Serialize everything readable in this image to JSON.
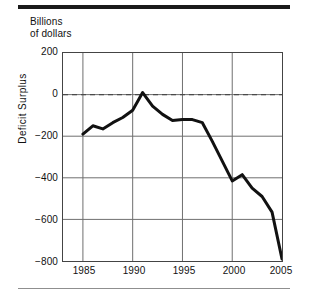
{
  "figure": {
    "title": "Billions\nof dollars",
    "rule_color": "#1a1a1a",
    "line_color": "#111111",
    "grid_color": "#6f6f6f",
    "frame_color": "#444444"
  },
  "chart_data": {
    "type": "line",
    "title": "Billions of dollars",
    "xlabel": "",
    "ylabel": "Deficit  Surplus",
    "xlim": [
      1983,
      2005
    ],
    "ylim": [
      -800,
      200
    ],
    "grid": true,
    "legend": "none",
    "zero_reference_line": {
      "value": 0,
      "style": "dashed"
    },
    "xticks": [
      1985,
      1990,
      1995,
      2000,
      2005
    ],
    "xtick_labels": [
      "1985",
      "1990",
      "1995",
      "2000",
      "2005"
    ],
    "yticks": [
      200,
      0,
      -200,
      -400,
      -600,
      -800
    ],
    "ytick_labels": [
      "200",
      "0",
      "−200",
      "−400",
      "−600",
      "−800"
    ],
    "series": [
      {
        "name": "Federal budget surplus or deficit",
        "x": [
          1985,
          1986,
          1987,
          1988,
          1989,
          1990,
          1991,
          1992,
          1993,
          1994,
          1995,
          1996,
          1997,
          1998,
          1999,
          2000,
          2001,
          2002,
          2003,
          2004,
          2005
        ],
        "values": [
          -190,
          -150,
          -165,
          -135,
          -110,
          -75,
          10,
          -55,
          -95,
          -125,
          -120,
          -120,
          -135,
          -225,
          -320,
          -415,
          -385,
          -450,
          -490,
          -565,
          -790
        ]
      }
    ]
  }
}
